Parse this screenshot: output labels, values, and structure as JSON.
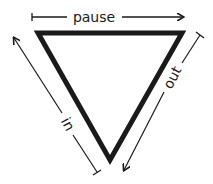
{
  "diagram": {
    "labels": {
      "top": "pause",
      "right": "out",
      "left": "in"
    },
    "colors": {
      "stroke": "#1a1a1a",
      "background": "#ffffff"
    }
  }
}
